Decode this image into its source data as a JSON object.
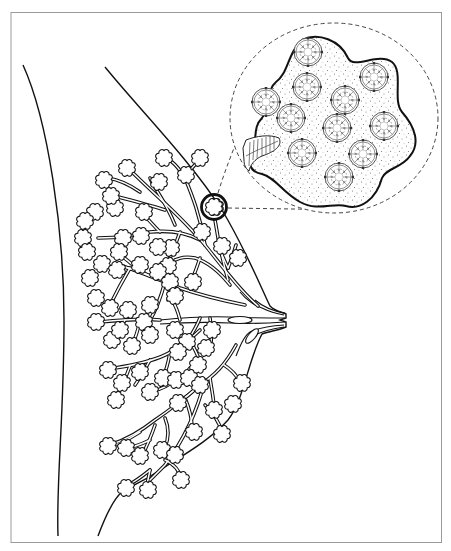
{
  "figure": {
    "title": "",
    "frame": {
      "x": 11,
      "y": 12,
      "width": 431,
      "height": 531,
      "stroke": "#9a9a9a"
    },
    "colors": {
      "line": "#111111",
      "dashed": "#444444",
      "stipple": "#777777",
      "background": "#ffffff"
    },
    "parts": [
      {
        "id": "chest-wall-outline",
        "label": ""
      },
      {
        "id": "breast-outline",
        "label": ""
      },
      {
        "id": "nipple",
        "label": ""
      },
      {
        "id": "milk-ducts",
        "label": ""
      },
      {
        "id": "lobules",
        "label": ""
      },
      {
        "id": "highlighted-lobule",
        "label": ""
      },
      {
        "id": "magnified-inset",
        "label": ""
      },
      {
        "id": "alveoli",
        "label": "",
        "count": 11
      },
      {
        "id": "duct-segment",
        "label": ""
      }
    ],
    "labels": []
  }
}
